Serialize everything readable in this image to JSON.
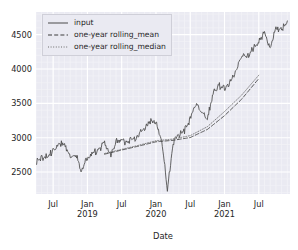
{
  "chart_data": {
    "type": "line",
    "title": "",
    "xlabel": "Date",
    "ylabel": "",
    "grid": true,
    "legend_position": "upper left",
    "xlim": [
      "2018-04-01",
      "2021-12-15"
    ],
    "ylim": [
      2180,
      4830
    ],
    "yticks": [
      2500,
      3000,
      3500,
      4000,
      4500
    ],
    "ytick_labels": [
      "2500",
      "3000",
      "3500",
      "4000",
      "4500"
    ],
    "xticks": [
      "2018-07",
      "2019-01",
      "2019-07",
      "2020-01",
      "2020-07",
      "2021-01",
      "2021-07"
    ],
    "xtick_labels": [
      {
        "line1": "Jul",
        "line2": ""
      },
      {
        "line1": "Jan",
        "line2": "2019"
      },
      {
        "line1": "Jul",
        "line2": ""
      },
      {
        "line1": "Jan",
        "line2": "2020"
      },
      {
        "line1": "Jul",
        "line2": ""
      },
      {
        "line1": "Jan",
        "line2": "2021"
      },
      {
        "line1": "Jul",
        "line2": ""
      }
    ],
    "colors": {
      "axes_background": "#eaeaf2",
      "grid_major": "#ffffff",
      "grid_minor": "#f2f2f7",
      "input_line": "#4a4a4a",
      "rolling_mean_line": "#3d3d3d",
      "rolling_median_line": "#6b6b6b",
      "tick_label": "#262626"
    },
    "series": [
      {
        "name": "input",
        "style": "solid",
        "x": [
          "2018-04",
          "2018-05",
          "2018-06",
          "2018-07",
          "2018-08",
          "2018-09",
          "2018-10",
          "2018-11",
          "2018-12",
          "2019-01",
          "2019-02",
          "2019-03",
          "2019-04",
          "2019-05",
          "2019-06",
          "2019-07",
          "2019-08",
          "2019-09",
          "2019-10",
          "2019-11",
          "2019-12",
          "2020-01",
          "2020-02",
          "2020-03",
          "2020-04",
          "2020-05",
          "2020-06",
          "2020-07",
          "2020-08",
          "2020-09",
          "2020-10",
          "2020-11",
          "2020-12",
          "2021-01",
          "2021-02",
          "2021-03",
          "2021-04",
          "2021-05",
          "2021-06",
          "2021-07",
          "2021-08",
          "2021-09",
          "2021-10",
          "2021-11",
          "2021-12"
        ],
        "values": [
          2640,
          2705,
          2718,
          2816,
          2902,
          2914,
          2711,
          2760,
          2507,
          2704,
          2784,
          2834,
          2946,
          2752,
          2942,
          2980,
          2926,
          2977,
          3038,
          3141,
          3231,
          3226,
          2954,
          2237,
          2912,
          3044,
          3100,
          3271,
          3500,
          3363,
          3270,
          3622,
          3756,
          3714,
          3811,
          3973,
          4181,
          4204,
          4298,
          4395,
          4523,
          4308,
          4605,
          4567,
          4700
        ],
        "annotations": [
          {
            "label": "COVID-19 crash low",
            "x": "2020-03",
            "y": 2237
          }
        ]
      },
      {
        "name": "one-year rolling_mean",
        "style": "dashed",
        "x": [
          "2019-04",
          "2019-07",
          "2019-10",
          "2020-01",
          "2020-04",
          "2020-07",
          "2020-10",
          "2021-01",
          "2021-04",
          "2021-07"
        ],
        "values": [
          2760,
          2820,
          2878,
          2940,
          2962,
          3002,
          3120,
          3320,
          3560,
          3860
        ]
      },
      {
        "name": "one-year rolling_median",
        "style": "dotted",
        "x": [
          "2019-04",
          "2019-07",
          "2019-10",
          "2020-01",
          "2020-04",
          "2020-07",
          "2020-10",
          "2021-01",
          "2021-04",
          "2021-07"
        ],
        "values": [
          2770,
          2830,
          2890,
          2955,
          2980,
          3030,
          3160,
          3380,
          3620,
          3910
        ]
      }
    ]
  },
  "legend": {
    "entries": [
      {
        "label": "input",
        "style": "solid"
      },
      {
        "label": "one-year rolling_mean",
        "style": "dashed"
      },
      {
        "label": "one-year rolling_median",
        "style": "dotted"
      }
    ]
  }
}
